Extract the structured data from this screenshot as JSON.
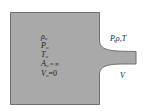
{
  "diagram": {
    "type": "reservoir-nozzle",
    "colors": {
      "fill": "#a9a9a9",
      "stroke": "#6f6f6f",
      "text": "#222222",
      "background": "#ffffff"
    },
    "reservoir_labels": [
      {
        "sym": "ρ",
        "sub": "o",
        "rest": ""
      },
      {
        "sym": "P",
        "sub": "o",
        "rest": ""
      },
      {
        "sym": "T",
        "sub": "o",
        "rest": ""
      },
      {
        "sym": "A",
        "sub": "o",
        "rest": " ≈ ∞"
      },
      {
        "sym": "V",
        "sub": "o",
        "rest": "=0"
      }
    ],
    "exit_state_label": "P,ρ,T",
    "exit_velocity_label": "V"
  }
}
